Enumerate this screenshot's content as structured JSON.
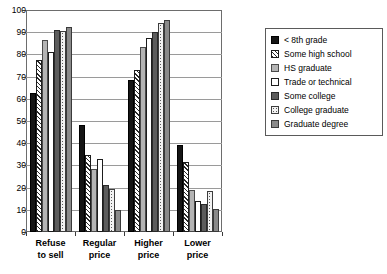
{
  "chart_data": {
    "type": "bar",
    "title": "",
    "subtitle": "",
    "xlabel": "",
    "ylabel": "",
    "ylim": [
      0,
      100
    ],
    "yticks": [
      0,
      10,
      20,
      30,
      40,
      50,
      60,
      70,
      80,
      90,
      100
    ],
    "ytick_labels": [
      "0",
      "10",
      "20",
      "30",
      "40",
      "50",
      "60",
      "70",
      "80",
      "90",
      "100"
    ],
    "grid": true,
    "grid_axis": "y",
    "legend_position": "right",
    "categories": [
      "Refuse to sell",
      "Regular price",
      "Higher price",
      "Lower price"
    ],
    "category_lines": [
      [
        "Refuse",
        "to sell"
      ],
      [
        "Regular",
        "price"
      ],
      [
        "Higher",
        "price"
      ],
      [
        "Lower",
        "price"
      ]
    ],
    "series": [
      {
        "name": "< 8th grade",
        "fill": "solid-black",
        "color": "#151515",
        "values": [
          62.5,
          48.0,
          68.5,
          39.0
        ]
      },
      {
        "name": "Some high school",
        "fill": "diagonal-hatch",
        "color": "#ffffff",
        "values": [
          77.5,
          34.5,
          73.0,
          31.5
        ]
      },
      {
        "name": "HS graduate",
        "fill": "light-gray",
        "color": "#b4b4b4",
        "values": [
          86.5,
          28.5,
          83.5,
          19.0
        ]
      },
      {
        "name": "Trade or technical",
        "fill": "white",
        "color": "#ffffff",
        "values": [
          81.0,
          33.0,
          87.5,
          14.0
        ]
      },
      {
        "name": "Some college",
        "fill": "dark-gray",
        "color": "#5c5c5c",
        "values": [
          91.0,
          21.0,
          90.0,
          12.5
        ]
      },
      {
        "name": "College graduate",
        "fill": "dotted",
        "color": "#f2f2f2",
        "values": [
          90.5,
          19.5,
          94.0,
          18.5
        ]
      },
      {
        "name": "Graduate degree",
        "fill": "medium-gray",
        "color": "#8a8a8a",
        "values": [
          92.5,
          10.0,
          95.5,
          10.5
        ]
      }
    ]
  },
  "legend": {
    "items": [
      {
        "label": "< 8th grade"
      },
      {
        "label": "Some high school"
      },
      {
        "label": "HS graduate"
      },
      {
        "label": "Trade or technical"
      },
      {
        "label": "Some college"
      },
      {
        "label": "College graduate"
      },
      {
        "label": "Graduate degree"
      }
    ]
  }
}
